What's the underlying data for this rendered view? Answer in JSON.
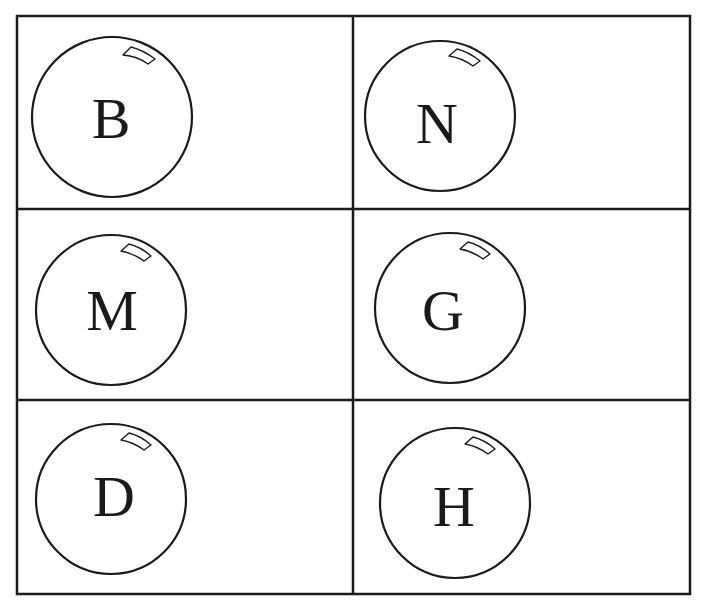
{
  "grid": {
    "rows": 3,
    "columns": 2,
    "line_color": "#1a1a1a"
  },
  "cells": [
    {
      "row": 0,
      "col": 0,
      "letter": "B"
    },
    {
      "row": 0,
      "col": 1,
      "letter": "N"
    },
    {
      "row": 1,
      "col": 0,
      "letter": "M"
    },
    {
      "row": 1,
      "col": 1,
      "letter": "G"
    },
    {
      "row": 2,
      "col": 0,
      "letter": "D"
    },
    {
      "row": 2,
      "col": 1,
      "letter": "H"
    }
  ],
  "bubble_icon": "bubble-with-highlight"
}
